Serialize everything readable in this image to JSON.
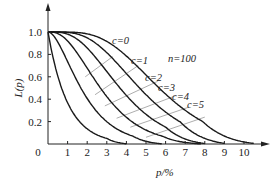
{
  "chart_data": {
    "type": "line",
    "title": "",
    "xlabel": "p/%",
    "ylabel": "L(p)",
    "annotation": "n=100",
    "xlim": [
      0,
      11
    ],
    "ylim": [
      0,
      1.1
    ],
    "x_ticks": [
      "0",
      "1",
      "2",
      "3",
      "4",
      "5",
      "6",
      "7",
      "8",
      "9",
      "10"
    ],
    "y_ticks": [
      "0.2",
      "0.4",
      "0.6",
      "0.8",
      "1.0"
    ],
    "origin_label": "0",
    "grid": false,
    "legend": "inline curve labels",
    "x": [
      0,
      1,
      2,
      3,
      4,
      5,
      6,
      7,
      8,
      9,
      10
    ],
    "series": [
      {
        "name": "c=0",
        "label": "c=0",
        "x_end": 4.0,
        "values": [
          1.0,
          0.368,
          0.135,
          0.05,
          0.018,
          null,
          null,
          null,
          null,
          null,
          null
        ]
      },
      {
        "name": "c=1",
        "label": "c=1",
        "x_end": 5.8,
        "values": [
          1.0,
          0.736,
          0.406,
          0.199,
          0.092,
          0.04,
          null,
          null,
          null,
          null,
          null
        ]
      },
      {
        "name": "c=2",
        "label": "c=2",
        "x_end": 7.8,
        "values": [
          1.0,
          0.92,
          0.677,
          0.423,
          0.238,
          0.125,
          0.062,
          0.03,
          null,
          null,
          null
        ]
      },
      {
        "name": "c=3",
        "label": "c=3",
        "x_end": 8.0,
        "values": [
          1.0,
          0.981,
          0.857,
          0.647,
          0.433,
          0.265,
          0.151,
          0.082,
          0.042,
          null,
          null
        ]
      },
      {
        "name": "c=4",
        "label": "c=4",
        "x_end": 9.0,
        "values": [
          1.0,
          0.996,
          0.947,
          0.815,
          0.629,
          0.44,
          0.285,
          0.173,
          0.1,
          0.055,
          null
        ]
      },
      {
        "name": "c=5",
        "label": "c=5",
        "x_end": 10.5,
        "values": [
          1.0,
          0.999,
          0.983,
          0.916,
          0.785,
          0.616,
          0.446,
          0.301,
          0.191,
          0.116,
          0.067
        ]
      }
    ],
    "label_positions": [
      {
        "text": "c=0",
        "px": 112,
        "py": 44
      },
      {
        "text": "c=1",
        "px": 131,
        "py": 64
      },
      {
        "text": "c=2",
        "px": 145,
        "py": 81
      },
      {
        "text": "c=3",
        "px": 158,
        "py": 91
      },
      {
        "text": "c=4",
        "px": 172,
        "py": 100
      },
      {
        "text": "c=5",
        "px": 187,
        "py": 108
      }
    ],
    "colors": {
      "curve": "#1a1a1a",
      "connector": "#8a8a8a",
      "axis": "#222222"
    }
  }
}
